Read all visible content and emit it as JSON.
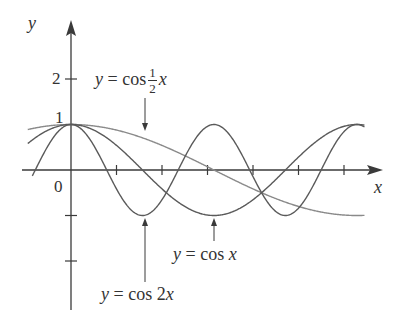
{
  "chart_data": {
    "type": "line",
    "title": "",
    "xlabel": "x",
    "ylabel": "y",
    "xlim": [
      -0.95,
      6.7
    ],
    "ylim": [
      -3.05,
      3.2
    ],
    "grid": false,
    "legend": "none (curves labeled with arrows)",
    "x_ticks": [
      1,
      2,
      3,
      4,
      5,
      6
    ],
    "y_ticks": [
      2,
      1,
      -1,
      -2
    ],
    "y_tick_labels": [
      "2",
      "1"
    ],
    "origin_label": "0",
    "series": [
      {
        "name": "y = cos ½x",
        "function": "cos(0.5*x)",
        "x_range": [
          -0.95,
          6.45
        ],
        "color": "#8a8a8a"
      },
      {
        "name": "y = cos x",
        "function": "cos(x)",
        "x_range": [
          -0.95,
          6.45
        ],
        "color": "#5a5a5a"
      },
      {
        "name": "y = cos 2x",
        "function": "cos(2*x)",
        "x_range": [
          -0.85,
          6.45
        ],
        "color": "#5a5a5a"
      }
    ],
    "annotations": [
      {
        "text": "y = cos ½x",
        "arrow_to": [
          2.45,
          0.94
        ]
      },
      {
        "text": "y = cos x",
        "arrow_to": [
          3.14,
          -1
        ]
      },
      {
        "text": "y = cos 2x",
        "arrow_to": [
          1.57,
          -1
        ]
      }
    ]
  },
  "labels": {
    "y_axis": "y",
    "x_axis": "x",
    "origin": "0",
    "tick_2": "2",
    "tick_1": "1",
    "half_label_prefix": "y = cos",
    "half_num": "1",
    "half_den": "2",
    "half_var": "x",
    "cosx_label": "y = cos x",
    "cos2x_label": "y = cos 2x"
  },
  "colors": {
    "axis": "#3a3a3a",
    "curve_dark": "#5a5a5a",
    "curve_light": "#8a8a8a",
    "text": "#333333"
  }
}
